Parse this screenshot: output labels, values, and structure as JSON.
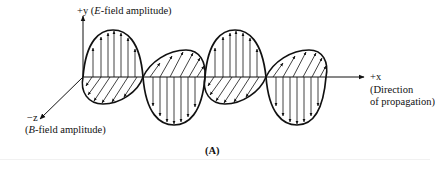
{
  "figure": {
    "caption": "(A)",
    "axes": {
      "y": {
        "sign": "+y",
        "open": " (",
        "italic": "E",
        "rest": "-field amplitude)"
      },
      "x": {
        "label": "+x",
        "note_line1": "(Direction",
        "note_line2": "of propagation)"
      },
      "z": {
        "label": "−z",
        "open": "(",
        "italic": "B",
        "rest": "-field amplitude)"
      }
    },
    "waves": {
      "e_field": {
        "orientation": "vertical",
        "lobes": [
          "up",
          "down",
          "up",
          "down"
        ],
        "vectors": "arrows"
      },
      "b_field": {
        "orientation": "horizontal",
        "lobes": [
          "toward -z",
          "toward +z",
          "toward -z",
          "toward +z"
        ],
        "vectors": "hatched arrows"
      }
    },
    "colors": {
      "ink": "#111111",
      "background": "#ffffff"
    }
  }
}
